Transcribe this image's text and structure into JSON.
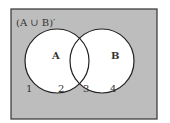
{
  "diagram": {
    "title": "(A ∪ B)′",
    "colors": {
      "universe": "#bdbdbd",
      "circle_fill": "#ffffff",
      "stroke": "#222222"
    },
    "sets": [
      {
        "name": "A",
        "label": "A"
      },
      {
        "name": "B",
        "label": "B"
      }
    ],
    "regions": [
      "1",
      "2",
      "3",
      "4"
    ]
  }
}
